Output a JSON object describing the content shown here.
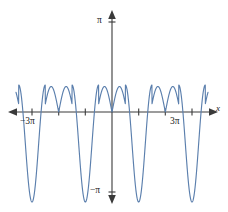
{
  "figure": {
    "title": "",
    "background_color": "#ffffff",
    "width": 228,
    "height": 212
  },
  "labels": {
    "x_axis_name": "x",
    "x_left_tick": "−3π",
    "x_right_tick": "3π",
    "y_top_tick": "π",
    "y_bottom_tick": "−π"
  },
  "colors": {
    "curve": "#5b7fad",
    "axis": "#3a3a3a",
    "text": "#222222",
    "background": "#ffffff"
  },
  "chart_data": {
    "type": "line",
    "title": "",
    "xlabel": "x",
    "ylabel": "",
    "grid": false,
    "legend": false,
    "xlim": [
      -3.6,
      3.6
    ],
    "ylim": [
      -1.15,
      1.15
    ],
    "xtick_labels": [
      "−3π",
      "3π"
    ],
    "xtick_values": [
      -3,
      3
    ],
    "ytick_labels": [
      "π",
      "−π"
    ],
    "ytick_values": [
      1,
      -1
    ],
    "x_unit": "π",
    "y_unit": "π",
    "period_in_pi": 2,
    "cusp_x_values": [
      -2,
      0,
      2
    ],
    "peak_x_values": [
      -2.5,
      -1.5,
      -0.5,
      0.5,
      1.5,
      2.5
    ],
    "peak_y_value": 0.3,
    "valley_x_values": [
      -3,
      -1,
      1,
      3
    ],
    "valley_y_value": -1,
    "series": [
      {
        "name": "y",
        "x": [
          -3.6,
          -3.5,
          -3.4,
          -3.3,
          -3.2,
          -3.1,
          -3.0,
          -2.9,
          -2.8,
          -2.7,
          -2.6,
          -2.5,
          -2.4,
          -2.3,
          -2.2,
          -2.1,
          -2.0,
          -1.9,
          -1.8,
          -1.7,
          -1.6,
          -1.5,
          -1.4,
          -1.3,
          -1.2,
          -1.1,
          -1.0,
          -0.9,
          -0.8,
          -0.7,
          -0.6,
          -0.5,
          -0.4,
          -0.3,
          -0.2,
          -0.1,
          0.0,
          0.1,
          0.2,
          0.3,
          0.4,
          0.5,
          0.6,
          0.7,
          0.8,
          0.9,
          1.0,
          1.1,
          1.2,
          1.3,
          1.4,
          1.5,
          1.6,
          1.7,
          1.8,
          1.9,
          2.0,
          2.1,
          2.2,
          2.3,
          2.4,
          2.5,
          2.6,
          2.7,
          2.8,
          2.9,
          3.0,
          3.1,
          3.2,
          3.3,
          3.4,
          3.5,
          3.6
        ],
        "y": [
          -0.82,
          -0.94,
          -1.0,
          -0.99,
          -0.92,
          -0.98,
          -1.0,
          -0.93,
          -0.72,
          -0.42,
          -0.07,
          0.3,
          0.17,
          -0.08,
          -0.01,
          0.17,
          0.3,
          0.17,
          -0.08,
          -0.01,
          0.17,
          0.3,
          -0.07,
          -0.42,
          -0.72,
          -0.93,
          -1.0,
          -0.93,
          -0.72,
          -0.42,
          -0.07,
          0.3,
          0.17,
          -0.08,
          -0.01,
          0.17,
          0.0,
          0.17,
          -0.01,
          -0.08,
          0.17,
          0.3,
          -0.07,
          -0.42,
          -0.72,
          -0.93,
          -1.0,
          -0.93,
          -0.72,
          -0.42,
          -0.07,
          0.3,
          0.17,
          -0.08,
          -0.01,
          0.17,
          0.0,
          0.17,
          -0.01,
          -0.08,
          0.17,
          0.3,
          -0.07,
          -0.42,
          -0.72,
          -0.93,
          -1.0,
          -0.98,
          -0.92,
          -0.99,
          -1.0,
          -0.94,
          -0.82
        ]
      }
    ]
  }
}
